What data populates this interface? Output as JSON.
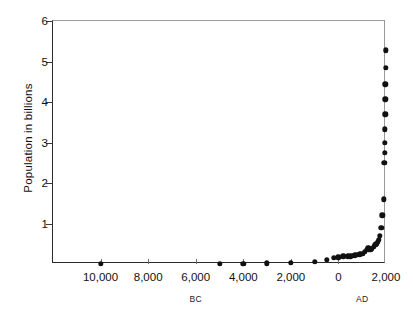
{
  "chart_data": {
    "type": "scatter",
    "title": "",
    "xlabel": "",
    "ylabel": "Population in billions",
    "xlim": [
      -12000,
      2000
    ],
    "ylim": [
      0,
      6
    ],
    "grid": false,
    "legend": null,
    "x_tick_labels": [
      "10,000",
      "8,000",
      "6,000",
      "4,000",
      "2,000",
      "0",
      "2,000"
    ],
    "x_tick_values": [
      -10000,
      -8000,
      -6000,
      -4000,
      -2000,
      0,
      2000
    ],
    "y_tick_labels": [
      "1",
      "2",
      "3",
      "4",
      "5",
      "6"
    ],
    "y_tick_values": [
      1,
      2,
      3,
      4,
      5,
      6
    ],
    "era_labels": [
      {
        "text": "BC",
        "x": -6000
      },
      {
        "text": "AD",
        "x": 1000
      }
    ],
    "series": [
      {
        "name": "World population",
        "points": [
          {
            "x": -10000,
            "y": 0.004
          },
          {
            "x": -5000,
            "y": 0.005
          },
          {
            "x": -4000,
            "y": 0.007
          },
          {
            "x": -3000,
            "y": 0.014
          },
          {
            "x": -2000,
            "y": 0.027
          },
          {
            "x": -1000,
            "y": 0.05
          },
          {
            "x": -500,
            "y": 0.1
          },
          {
            "x": -200,
            "y": 0.15
          },
          {
            "x": 0,
            "y": 0.17
          },
          {
            "x": 200,
            "y": 0.19
          },
          {
            "x": 400,
            "y": 0.19
          },
          {
            "x": 500,
            "y": 0.19
          },
          {
            "x": 600,
            "y": 0.2
          },
          {
            "x": 700,
            "y": 0.21
          },
          {
            "x": 800,
            "y": 0.22
          },
          {
            "x": 900,
            "y": 0.24
          },
          {
            "x": 1000,
            "y": 0.25
          },
          {
            "x": 1100,
            "y": 0.3
          },
          {
            "x": 1200,
            "y": 0.35
          },
          {
            "x": 1250,
            "y": 0.4
          },
          {
            "x": 1300,
            "y": 0.36
          },
          {
            "x": 1350,
            "y": 0.35
          },
          {
            "x": 1400,
            "y": 0.37
          },
          {
            "x": 1500,
            "y": 0.43
          },
          {
            "x": 1550,
            "y": 0.47
          },
          {
            "x": 1600,
            "y": 0.5
          },
          {
            "x": 1650,
            "y": 0.55
          },
          {
            "x": 1700,
            "y": 0.6
          },
          {
            "x": 1750,
            "y": 0.69
          },
          {
            "x": 1800,
            "y": 0.9
          },
          {
            "x": 1850,
            "y": 1.2
          },
          {
            "x": 1900,
            "y": 1.6
          },
          {
            "x": 1930,
            "y": 2.5
          },
          {
            "x": 1940,
            "y": 2.74
          },
          {
            "x": 1950,
            "y": 3.0
          },
          {
            "x": 1960,
            "y": 3.33
          },
          {
            "x": 1965,
            "y": 3.7
          },
          {
            "x": 1970,
            "y": 4.07
          },
          {
            "x": 1975,
            "y": 4.44
          },
          {
            "x": 1980,
            "y": 4.85
          },
          {
            "x": 1990,
            "y": 5.28
          }
        ]
      }
    ],
    "colors": {
      "marker": "#111111",
      "axis": "#2b2b2b",
      "background": "#ffffff"
    }
  }
}
